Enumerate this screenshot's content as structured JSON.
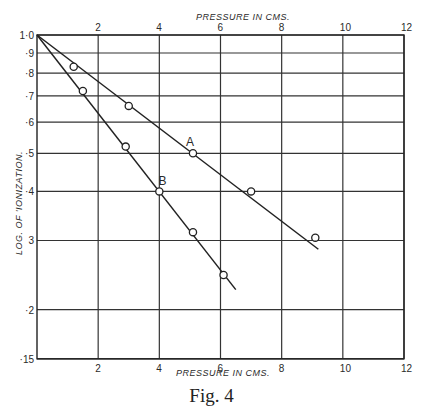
{
  "chart_data": {
    "type": "line",
    "title": "",
    "caption": "Fig. 4",
    "xlabel": "Pressure in cms.",
    "xlabel_top": "Pressure in cms.",
    "ylabel": "Log. of Ionization.",
    "x_ticks": [
      2,
      4,
      6,
      8,
      10,
      12
    ],
    "x_tick_labels": [
      "2",
      "4",
      "6",
      "8",
      "10",
      "12"
    ],
    "y_scale": "log",
    "y_ticks": [
      1.0,
      0.9,
      0.8,
      0.7,
      0.6,
      0.5,
      0.4,
      0.3,
      0.2,
      0.15
    ],
    "y_tick_labels": [
      "1·0",
      "·9",
      "·8",
      "·7",
      "·6",
      "·5",
      "·4",
      "3",
      "·2",
      "·15"
    ],
    "xlim": [
      0,
      12
    ],
    "ylim": [
      0.15,
      1.0
    ],
    "grid": true,
    "legend": "inline labels",
    "series": [
      {
        "name": "A",
        "line": [
          [
            0,
            1.0
          ],
          [
            9.2,
            0.285
          ]
        ],
        "points": [
          [
            1.2,
            0.83
          ],
          [
            3.0,
            0.66
          ],
          [
            5.1,
            0.5
          ],
          [
            7.0,
            0.4
          ],
          [
            9.1,
            0.305
          ]
        ],
        "label_pos": [
          5.0,
          0.535
        ]
      },
      {
        "name": "B",
        "line": [
          [
            0,
            1.0
          ],
          [
            6.5,
            0.225
          ]
        ],
        "points": [
          [
            1.5,
            0.72
          ],
          [
            2.9,
            0.52
          ],
          [
            4.0,
            0.4
          ],
          [
            5.1,
            0.315
          ],
          [
            6.1,
            0.245
          ]
        ],
        "label_pos": [
          4.1,
          0.425
        ]
      }
    ]
  },
  "labels": {
    "x_axis_top": "PRESSURE IN CMS.",
    "x_axis_bottom": "PRESSURE IN CMS.",
    "y_axis": "LOG. OF 'IONIZATION.",
    "caption": "Fig. 4"
  }
}
